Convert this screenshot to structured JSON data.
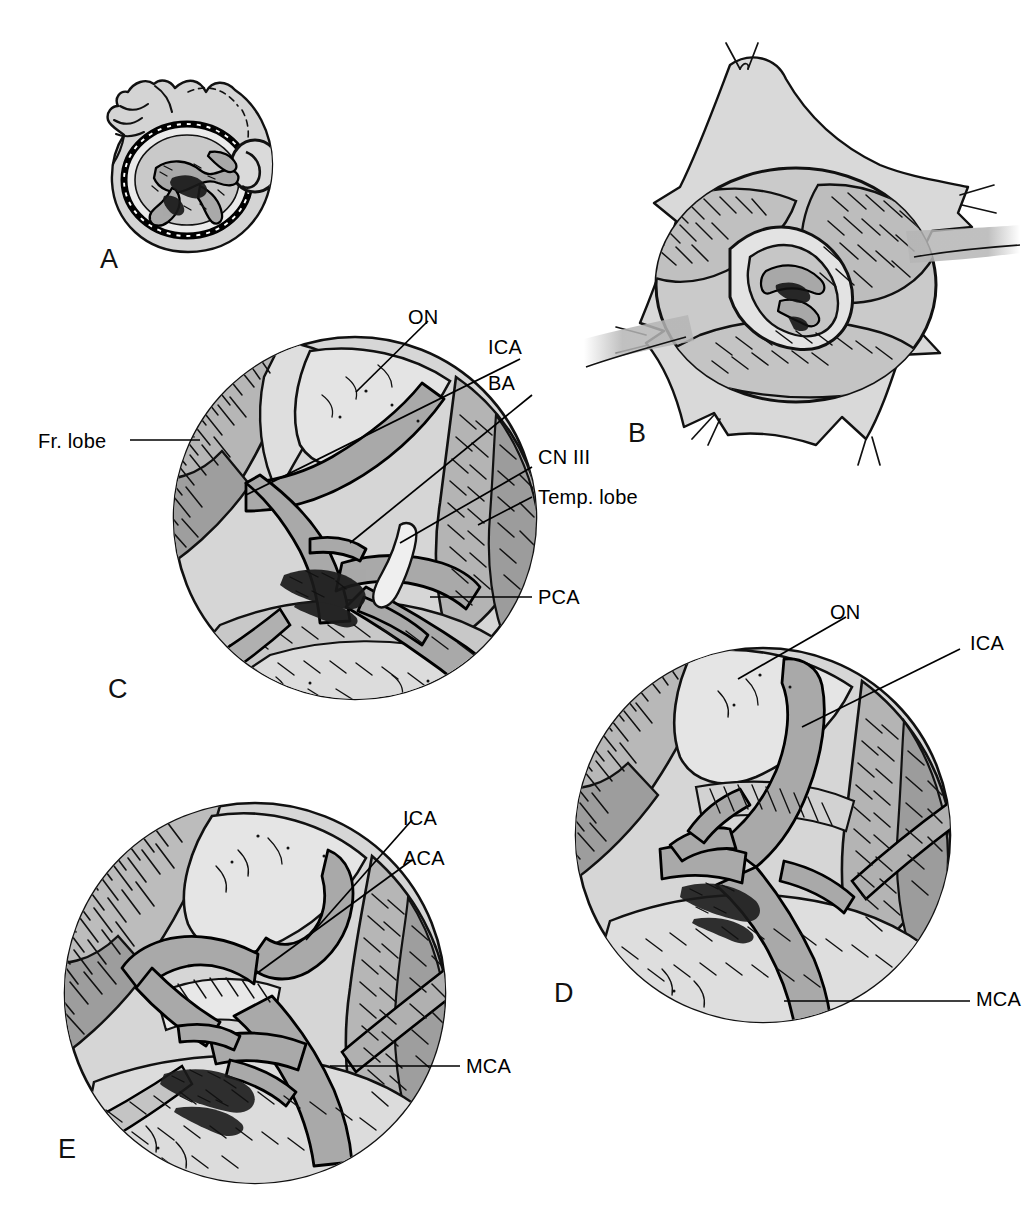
{
  "figure": {
    "kind": "surgical-anatomy-illustration",
    "panel_count": 5,
    "colors": {
      "ink": "#000000",
      "background": "#ffffff",
      "tissue_light": "#dcdcdc",
      "tissue_mid": "#b4b4b4",
      "tissue_dark": "#9a9a9a",
      "vessel": "#a8a8a8",
      "shadow": "#8c8c8c"
    }
  },
  "panels": [
    {
      "letter": "A",
      "name": "head-position-craniotomy",
      "caption": "Head in position with pterional craniotomy outline",
      "labels": []
    },
    {
      "letter": "B",
      "name": "dural-opening-retraction",
      "caption": "Dura opened and retracted with tack-up sutures exposing sylvian fissure",
      "labels": []
    },
    {
      "letter": "C",
      "name": "microscopic-view-basilar",
      "caption": "Microscopic view after sylvian fissure split",
      "labels": [
        {
          "text": "Fr. lobe",
          "id": "frontal-lobe",
          "side": "left"
        },
        {
          "text": "ON",
          "id": "optic-nerve",
          "side": "top"
        },
        {
          "text": "ICA",
          "id": "internal-carotid-artery",
          "side": "right"
        },
        {
          "text": "BA",
          "id": "basilar-artery",
          "side": "right"
        },
        {
          "text": "CN III",
          "id": "cranial-nerve-three",
          "side": "right"
        },
        {
          "text": "Temp. lobe",
          "id": "temporal-lobe",
          "side": "right"
        },
        {
          "text": "PCA",
          "id": "posterior-cerebral-artery",
          "side": "right"
        }
      ]
    },
    {
      "letter": "D",
      "name": "microscopic-view-carotid-bifurcation",
      "caption": "Microscopic view of the carotid bifurcation",
      "labels": [
        {
          "text": "ON",
          "id": "optic-nerve",
          "side": "top"
        },
        {
          "text": "ICA",
          "id": "internal-carotid-artery",
          "side": "right"
        },
        {
          "text": "MCA",
          "id": "middle-cerebral-artery",
          "side": "right"
        }
      ]
    },
    {
      "letter": "E",
      "name": "microscopic-view-aca-mca",
      "caption": "Microscopic view of the ACA and MCA origins",
      "labels": [
        {
          "text": "ICA",
          "id": "internal-carotid-artery",
          "side": "right"
        },
        {
          "text": "ACA",
          "id": "anterior-cerebral-artery",
          "side": "right"
        },
        {
          "text": "MCA",
          "id": "middle-cerebral-artery",
          "side": "right"
        }
      ]
    }
  ]
}
